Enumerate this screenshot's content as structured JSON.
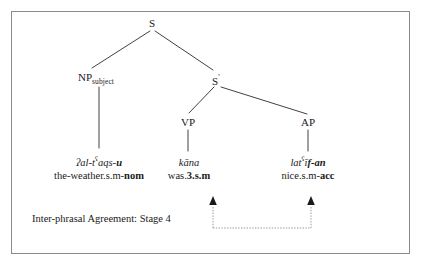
{
  "diagram": {
    "type": "syntax-tree",
    "language_example": "Arabic",
    "frame": {
      "border_color": "#8a8a8a"
    },
    "nodes": {
      "root": {
        "label": "S"
      },
      "np": {
        "label": "NP",
        "subscript": "subject"
      },
      "sbar": {
        "label": "S",
        "prime": "'"
      },
      "vp": {
        "label": "VP"
      },
      "ap": {
        "label": "AP"
      }
    },
    "lexical_items": [
      {
        "id": "np-lex",
        "form_prefix": "ʔal-t",
        "form_pharyngeal": "ʕ",
        "form_mid": "aqs-",
        "form_bold": "u",
        "gloss_plain": "the-weather.s.m-",
        "gloss_bold": "nom"
      },
      {
        "id": "vp-lex",
        "form_prefix": "kāna",
        "form_pharyngeal": "",
        "form_mid": "",
        "form_bold": "",
        "gloss_plain": "was.",
        "gloss_bold": "3.s.m"
      },
      {
        "id": "ap-lex",
        "form_prefix": "lat",
        "form_pharyngeal": "ʕ",
        "form_mid": "ī",
        "form_bold": "f-an",
        "gloss_plain": "nice.s.m-",
        "gloss_bold": "acc"
      }
    ],
    "annotation": {
      "label": "Inter-phrasal Agreement: Stage 4",
      "bracket_color": "#8d8d8d",
      "arrow_color": "#1a1a1a"
    }
  }
}
